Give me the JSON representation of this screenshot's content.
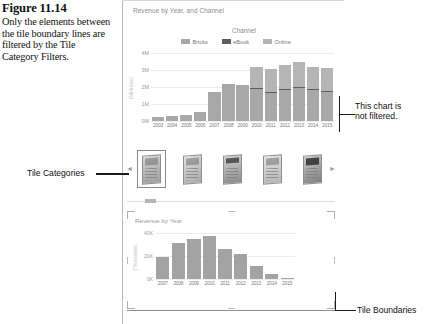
{
  "figure": {
    "number": "Figure 11.14",
    "caption": "Only the elements between the tile boundary lines are filtered by the Tile Category Filters."
  },
  "annotations": {
    "tile_categories": "Tile Categories",
    "chart_not_filtered_line1": "This chart is",
    "chart_not_filtered_line2": "not filtered.",
    "tile_boundaries": "Tile Boundaries"
  },
  "colors": {
    "bricks": "#a8a8a8",
    "ebook": "#5e5e5e",
    "online": "#b5b5b5",
    "grid": "#ececec",
    "axis_text": "#8d8d8d",
    "bottom_bar": "#a3a3a3"
  },
  "tile_strip": {
    "prev_arrow": "◄",
    "next_arrow": "►",
    "thumbnails": [
      {
        "name": "book-cover-1",
        "selected": true
      },
      {
        "name": "book-cover-2",
        "selected": false
      },
      {
        "name": "book-cover-3",
        "selected": false
      },
      {
        "name": "book-cover-4",
        "selected": false
      },
      {
        "name": "book-cover-5",
        "selected": false
      }
    ]
  },
  "chart_data": [
    {
      "id": "top",
      "type": "bar",
      "stacked": true,
      "title": "Revenue by Year, and Channel",
      "legend_title": "Channel",
      "legend_position": "top",
      "xlabel": "",
      "ylabel": "(Millions)",
      "ylim": [
        0,
        4
      ],
      "yticks": [
        "0M",
        "1M",
        "2M",
        "3M",
        "4M"
      ],
      "grid": true,
      "categories": [
        "2003",
        "2004",
        "2005",
        "2006",
        "2007",
        "2008",
        "2009",
        "2010",
        "2011",
        "2012",
        "2013",
        "2014",
        "2015"
      ],
      "series": [
        {
          "name": "Bricks",
          "values": [
            0.22,
            0.3,
            0.36,
            0.52,
            1.7,
            2.15,
            2.1,
            1.88,
            1.62,
            1.8,
            1.92,
            1.8,
            1.7
          ]
        },
        {
          "name": "eBook",
          "values": [
            0.0,
            0.0,
            0.0,
            0.0,
            0.0,
            0.0,
            0.0,
            0.06,
            0.06,
            0.06,
            0.06,
            0.06,
            0.06
          ]
        },
        {
          "name": "Online",
          "values": [
            0.0,
            0.0,
            0.0,
            0.0,
            0.0,
            0.05,
            0.02,
            1.26,
            1.38,
            1.44,
            1.52,
            1.34,
            1.34
          ]
        }
      ]
    },
    {
      "id": "bottom",
      "type": "bar",
      "stacked": false,
      "title": "Revenue by Year",
      "xlabel": "",
      "ylabel": "(Thousands)",
      "ylim": [
        0,
        40
      ],
      "yticks": [
        "0K",
        "20K",
        "40K"
      ],
      "grid": true,
      "categories": [
        "2007",
        "2008",
        "2009",
        "2010",
        "2011",
        "2012",
        "2013",
        "2014",
        "2015"
      ],
      "values": [
        19,
        31,
        35,
        37,
        26,
        22,
        11,
        4,
        1
      ]
    }
  ],
  "scrollbar": {
    "orientation": "horizontal",
    "thumb_position_pct": 9
  }
}
